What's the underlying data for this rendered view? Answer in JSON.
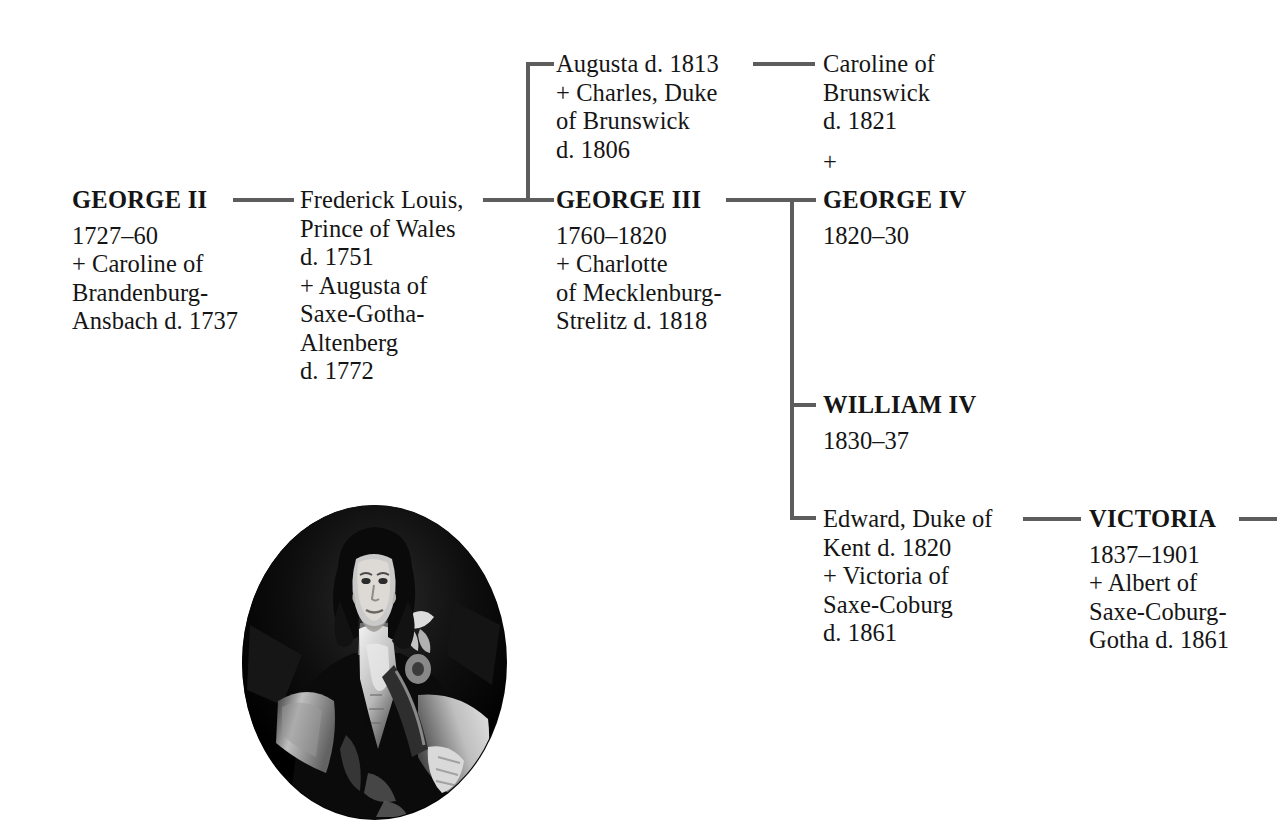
{
  "diagram": {
    "line_color": "#5d5d5d",
    "text_color": "#151515"
  },
  "people": {
    "george2": {
      "name": "GEORGE II",
      "lines": [
        "1727–60",
        "+ Caroline of",
        "Brandenburg-",
        "Ansbach d. 1737"
      ]
    },
    "frederick": {
      "name_lines": [
        "Frederick Louis,",
        "Prince of Wales"
      ],
      "lines": [
        "d. 1751",
        "+ Augusta of",
        "Saxe-Gotha-",
        "Altenberg",
        "d. 1772"
      ]
    },
    "augusta": {
      "name_lines": [
        "Augusta d. 1813",
        "+ Charles, Duke",
        "of Brunswick",
        "d. 1806"
      ],
      "lines": []
    },
    "george3": {
      "name": "GEORGE III",
      "lines": [
        "1760–1820",
        "+ Charlotte",
        "of Mecklenburg-",
        "Strelitz d. 1818"
      ]
    },
    "caroline_brunswick": {
      "name_lines": [
        "Caroline of",
        "Brunswick",
        "d. 1821"
      ],
      "plus": "+"
    },
    "george4": {
      "name": "GEORGE IV",
      "lines": [
        "1820–30"
      ]
    },
    "william4": {
      "name": "WILLIAM IV",
      "lines": [
        "1830–37"
      ]
    },
    "edward_kent": {
      "name_lines": [
        "Edward, Duke of",
        "Kent d. 1820",
        "+ Victoria of",
        "Saxe-Coburg",
        "d. 1861"
      ]
    },
    "victoria": {
      "name": "VICTORIA",
      "lines": [
        "1837–1901",
        "+ Albert of",
        "Saxe-Coburg-",
        "Gotha d. 1861"
      ]
    }
  },
  "portrait": {
    "caption": "",
    "alt_name": "oval-portrait-george-ii"
  }
}
